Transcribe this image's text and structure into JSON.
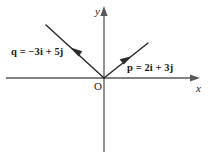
{
  "figure": {
    "background_color": "#ffffff",
    "stroke_color": "#4d4d4d",
    "vector_color": "#2b2b2b",
    "text_color": "#1a1a1a",
    "width": 208,
    "height": 160
  },
  "axes": {
    "y_label": "y",
    "x_label": "x",
    "origin_label": "O",
    "origin": {
      "x": 104,
      "y": 78
    },
    "x_axis": {
      "start_x": 6,
      "end_x": 200,
      "y": 78,
      "arrow": "right"
    },
    "y_axis": {
      "x": 104,
      "start_y": 152,
      "end_y": 6,
      "arrow": "up"
    }
  },
  "vectors": [
    {
      "name": "q",
      "label": "q = −3i + 5j",
      "components": {
        "i": -3,
        "j": 5
      },
      "tail": {
        "x": 104,
        "y": 78
      },
      "head": {
        "x": 46,
        "y": 25
      },
      "arrowhead_at": {
        "x": 75,
        "y": 52
      },
      "label_position": {
        "x": 11,
        "y": 47
      }
    },
    {
      "name": "p",
      "label": "p = 2i + 3j",
      "components": {
        "i": 2,
        "j": 3
      },
      "tail": {
        "x": 104,
        "y": 78
      },
      "head": {
        "x": 148,
        "y": 43
      },
      "arrowhead_at": {
        "x": 126,
        "y": 61
      },
      "label_position": {
        "x": 127,
        "y": 63
      }
    }
  ]
}
